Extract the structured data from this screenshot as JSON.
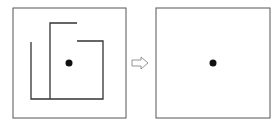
{
  "diagram": {
    "colors": {
      "frame": "#555555",
      "line": "#333333",
      "dot": "#111111",
      "arrow": "#888888"
    },
    "left_panel": {
      "frame": {
        "x": 13,
        "y": 8,
        "w": 113,
        "h": 110
      },
      "dot": {
        "cx": 69,
        "cy": 63,
        "r": 3.5
      },
      "maze_paths": [
        "M31,42 L31,99 L103,99 L103,41 L77,41",
        "M50,99 L50,23 L77,23"
      ]
    },
    "arrow": {
      "points": "132,60 141,60 141,57 148,63 141,69 141,66 132,66"
    },
    "right_panel": {
      "frame": {
        "x": 156,
        "y": 8,
        "w": 114,
        "h": 110
      },
      "dot": {
        "cx": 213,
        "cy": 63,
        "r": 3.5
      }
    }
  }
}
